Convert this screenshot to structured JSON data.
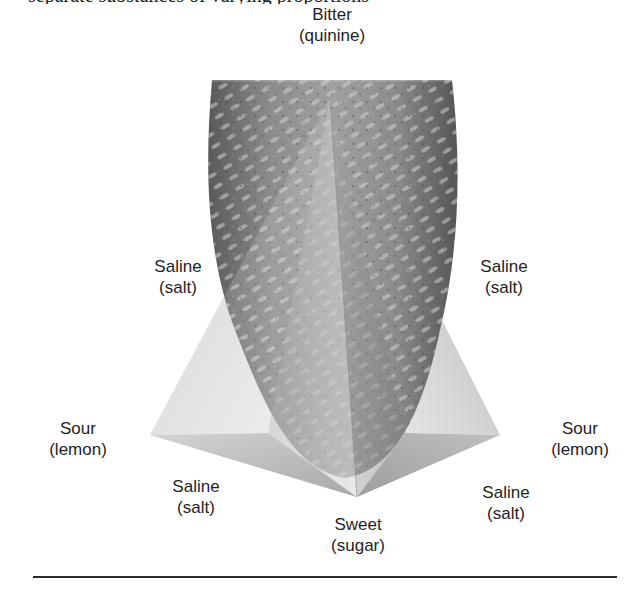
{
  "header": {
    "cut_off_text": "separate substances of varying proportions"
  },
  "figure": {
    "labels": {
      "top": {
        "taste": "Bitter",
        "substance": "(quinine)"
      },
      "upper_left": {
        "taste": "Saline",
        "substance": "(salt)"
      },
      "upper_right": {
        "taste": "Saline",
        "substance": "(salt)"
      },
      "left": {
        "taste": "Sour",
        "substance": "(lemon)"
      },
      "right": {
        "taste": "Sour",
        "substance": "(lemon)"
      },
      "lower_left": {
        "taste": "Saline",
        "substance": "(salt)"
      },
      "lower_right": {
        "taste": "Saline",
        "substance": "(salt)"
      },
      "bottom": {
        "taste": "Sweet",
        "substance": "(sugar)"
      }
    },
    "colors": {
      "tongue_dark": "#5a5a5a",
      "tongue_mid": "#8a8a8a",
      "pyramid_light": "#e6e6e6",
      "pyramid_mid": "#b8b8b8",
      "rule": "#2a2a2a"
    }
  }
}
